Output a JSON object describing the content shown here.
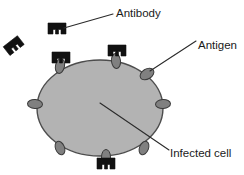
{
  "figure": {
    "background_color": "#ffffff"
  },
  "labels": {
    "antibody": "Antibody",
    "antigen": "Antigen",
    "infected_cell": "Infected cell"
  },
  "colors": {
    "cell_fill": "#b3b3b3",
    "cell_stroke": "#4d4d4d",
    "antigen_fill": "#808080",
    "antigen_stroke": "#3a3a3a",
    "antibody_fill": "#111111",
    "leader_line": "#2b2b2b",
    "text": "#1a1a1a"
  },
  "diagram": {
    "cell": {
      "name": "infected-cell",
      "shape": "ellipse",
      "cx": 100,
      "cy": 108,
      "rx": 63,
      "ry": 48
    },
    "antigens": [
      {
        "name": "antigen-top-left",
        "cx": 60,
        "cy": 66,
        "rx": 4.5,
        "ry": 7.5,
        "rotate": 12
      },
      {
        "name": "antigen-top-center",
        "cx": 116,
        "cy": 61,
        "rx": 4.5,
        "ry": 7.5,
        "rotate": -6
      },
      {
        "name": "antigen-upper-right",
        "cx": 147,
        "cy": 74,
        "rx": 7.5,
        "ry": 5.0,
        "rotate": -32
      },
      {
        "name": "antigen-right",
        "cx": 163,
        "cy": 104,
        "rx": 7.5,
        "ry": 4.5,
        "rotate": -4
      },
      {
        "name": "antigen-left",
        "cx": 35,
        "cy": 104,
        "rx": 7.5,
        "ry": 4.5,
        "rotate": 4
      },
      {
        "name": "antigen-bottom-left",
        "cx": 60,
        "cy": 148,
        "rx": 4.5,
        "ry": 7.0,
        "rotate": -22
      },
      {
        "name": "antigen-bottom-right",
        "cx": 144,
        "cy": 148,
        "rx": 4.5,
        "ry": 7.0,
        "rotate": 22
      },
      {
        "name": "antigen-bottom",
        "cx": 106,
        "cy": 157,
        "rx": 4.5,
        "ry": 7.5,
        "rotate": 0
      }
    ],
    "antibodies": [
      {
        "name": "antibody-free-labeled",
        "cx": 57,
        "cy": 29,
        "rotate": 0,
        "bound": false
      },
      {
        "name": "antibody-free-left",
        "cx": 14,
        "cy": 46,
        "rotate": -38,
        "bound": false
      },
      {
        "name": "antibody-bound-top-left",
        "cx": 61,
        "cy": 58,
        "rotate": 0,
        "bound": true
      },
      {
        "name": "antibody-bound-top-center",
        "cx": 117,
        "cy": 51,
        "rotate": 0,
        "bound": true
      },
      {
        "name": "antibody-bound-bottom",
        "cx": 106,
        "cy": 164,
        "rotate": 0,
        "bound": true
      }
    ],
    "leaders": [
      {
        "name": "leader-antibody",
        "x1": 64,
        "y1": 28,
        "x2": 113,
        "y2": 14
      },
      {
        "name": "leader-antigen",
        "x1": 150,
        "y1": 71,
        "x2": 196,
        "y2": 41
      },
      {
        "name": "leader-infected-cell",
        "x1": 100,
        "y1": 103,
        "x2": 169,
        "y2": 150
      }
    ],
    "label_positions": {
      "antibody": {
        "x": 116,
        "y": 17
      },
      "antigen": {
        "x": 198,
        "y": 49
      },
      "infected_cell": {
        "x": 170,
        "y": 157
      }
    }
  }
}
